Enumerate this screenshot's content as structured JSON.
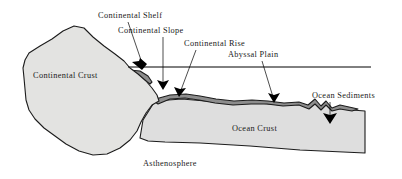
{
  "figure": {
    "background_color": "#ffffff"
  },
  "colors": {
    "continental_crust_fill": "#e3e3e1",
    "ocean_crust_fill": "#dedede",
    "sediment_fill": "#8d8d8d",
    "outline": "#1c1c1c",
    "text": "#1a1a1a",
    "leader_line": "#000000",
    "sea_level_line": "#000000"
  },
  "callout_labels": [
    {
      "id": "continental-shelf",
      "text": "Continental Shelf",
      "x": 98,
      "y": 18
    },
    {
      "id": "continental-slope",
      "text": "Continental Slope",
      "x": 118,
      "y": 33
    },
    {
      "id": "continental-rise",
      "text": "Continental Rise",
      "x": 184,
      "y": 46
    },
    {
      "id": "abyssal-plain",
      "text": "Abyssal Plain",
      "x": 228,
      "y": 57
    },
    {
      "id": "ocean-sediments",
      "text": "Ocean Sediments",
      "x": 312,
      "y": 98
    }
  ],
  "region_labels": [
    {
      "id": "continental-crust",
      "text": "Continental Crust",
      "x": 33,
      "y": 78
    },
    {
      "id": "ocean-crust",
      "text": "Ocean Crust",
      "x": 232,
      "y": 131
    },
    {
      "id": "asthenosphere",
      "text": "Asthenosphere",
      "x": 143,
      "y": 166
    }
  ],
  "annotations": {
    "sea_level_line": {
      "x1": 128,
      "y1": 67,
      "x2": 371,
      "y2": 67
    },
    "leaders": [
      {
        "id": "leader-continental-shelf",
        "from_x": 128,
        "from_y": 22,
        "to_x": 142,
        "to_y": 63
      },
      {
        "id": "leader-continental-slope",
        "from_x": 163,
        "from_y": 37,
        "to_x": 163,
        "to_y": 83
      },
      {
        "id": "leader-continental-rise",
        "from_x": 196,
        "from_y": 50,
        "to_x": 181,
        "to_y": 90
      },
      {
        "id": "leader-abyssal-plain",
        "from_x": 262,
        "from_y": 61,
        "to_x": 272,
        "to_y": 97
      },
      {
        "id": "leader-ocean-sediments",
        "from_x": 330,
        "from_y": 102,
        "to_x": 330,
        "to_y": 117
      }
    ],
    "arrowheads": [
      {
        "id": "arrow-continental-shelf",
        "x": 142,
        "y": 68,
        "angle": 70
      },
      {
        "id": "arrow-continental-slope",
        "x": 163,
        "y": 88,
        "angle": 90
      },
      {
        "id": "arrow-continental-rise",
        "x": 180,
        "y": 95,
        "angle": 110
      },
      {
        "id": "arrow-abyssal-plain",
        "x": 273,
        "y": 102,
        "angle": 75
      },
      {
        "id": "arrow-ocean-sediments",
        "x": 330,
        "y": 122,
        "angle": 90
      }
    ]
  },
  "shapes": {
    "continental_crust_name": "continental-crust-body",
    "ocean_crust_name": "ocean-crust-body",
    "sediment_name": "ocean-sediment-layer"
  }
}
